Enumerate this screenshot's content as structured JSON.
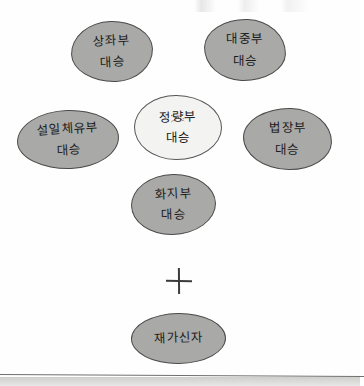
{
  "diagram": {
    "type": "hand-drawn concept sketch",
    "colors": {
      "blob_fill": "#a9a9a7",
      "blob_fill_highlight": "#f3f3f1",
      "blob_stroke": "#4a4a4a",
      "text": "#1c1c1c",
      "page_background": "#fefefe",
      "page_edge_band": "#dcdcda"
    },
    "nodes": [
      {
        "id": "sthavira",
        "title": "상좌부",
        "subtitle": "대승",
        "highlight": false
      },
      {
        "id": "mahasamghika",
        "title": "대중부",
        "subtitle": "대승",
        "highlight": false
      },
      {
        "id": "sarvastivada",
        "title": "설일체유부",
        "subtitle": "대승",
        "highlight": false
      },
      {
        "id": "sammatiya",
        "title": "정량부",
        "subtitle": "대승",
        "highlight": true
      },
      {
        "id": "dharmaguptaka",
        "title": "법장부",
        "subtitle": "대승",
        "highlight": false
      },
      {
        "id": "mahisasaka",
        "title": "화지부",
        "subtitle": "대승",
        "highlight": false
      },
      {
        "id": "laity",
        "title": "재가신자",
        "subtitle": "",
        "highlight": false
      }
    ],
    "connector": {
      "symbol": "+",
      "name": "plus-sign"
    }
  }
}
